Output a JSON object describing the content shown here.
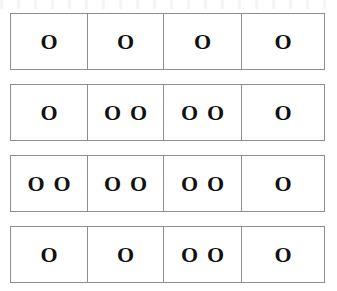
{
  "page": {
    "background_color": "#ffffff",
    "border_color": "#8d8d91",
    "token_color": "#111111",
    "token_glyph": "O"
  },
  "artifact": {
    "name": "scan-artifact-band",
    "description": "faint cut-off scan noise along top edge"
  },
  "grid": {
    "row_count": 4,
    "column_count": 4,
    "rows": [
      {
        "row_label": "row-1",
        "cells": [
          {
            "cell_label": "row-1-cell-1",
            "count": 1,
            "tokens": [
              "O"
            ]
          },
          {
            "cell_label": "row-1-cell-2",
            "count": 1,
            "tokens": [
              "O"
            ]
          },
          {
            "cell_label": "row-1-cell-3",
            "count": 1,
            "tokens": [
              "O"
            ]
          },
          {
            "cell_label": "row-1-cell-4",
            "count": 1,
            "tokens": [
              "O"
            ]
          }
        ]
      },
      {
        "row_label": "row-2",
        "cells": [
          {
            "cell_label": "row-2-cell-1",
            "count": 1,
            "tokens": [
              "O"
            ]
          },
          {
            "cell_label": "row-2-cell-2",
            "count": 2,
            "tokens": [
              "O",
              "O"
            ]
          },
          {
            "cell_label": "row-2-cell-3",
            "count": 2,
            "tokens": [
              "O",
              "O"
            ]
          },
          {
            "cell_label": "row-2-cell-4",
            "count": 1,
            "tokens": [
              "O"
            ]
          }
        ]
      },
      {
        "row_label": "row-3",
        "cells": [
          {
            "cell_label": "row-3-cell-1",
            "count": 2,
            "tokens": [
              "O",
              "O"
            ]
          },
          {
            "cell_label": "row-3-cell-2",
            "count": 2,
            "tokens": [
              "O",
              "O"
            ]
          },
          {
            "cell_label": "row-3-cell-3",
            "count": 2,
            "tokens": [
              "O",
              "O"
            ]
          },
          {
            "cell_label": "row-3-cell-4",
            "count": 1,
            "tokens": [
              "O"
            ]
          }
        ]
      },
      {
        "row_label": "row-4",
        "cells": [
          {
            "cell_label": "row-4-cell-1",
            "count": 1,
            "tokens": [
              "O"
            ]
          },
          {
            "cell_label": "row-4-cell-2",
            "count": 1,
            "tokens": [
              "O"
            ]
          },
          {
            "cell_label": "row-4-cell-3",
            "count": 2,
            "tokens": [
              "O",
              "O"
            ]
          },
          {
            "cell_label": "row-4-cell-4",
            "count": 1,
            "tokens": [
              "O"
            ]
          }
        ]
      }
    ]
  }
}
